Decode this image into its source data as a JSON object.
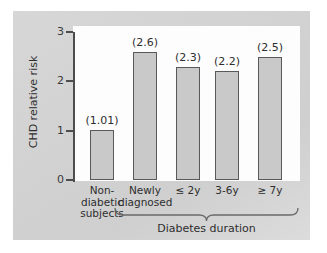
{
  "chart_data": {
    "type": "bar",
    "title": "",
    "xlabel": "",
    "ylabel": "CHD relative risk",
    "ylim": [
      0,
      3
    ],
    "yticks": [
      "0",
      "1",
      "2",
      "3"
    ],
    "grid": false,
    "legend": "none",
    "categories": [
      "Non-\ndiabetic\nsubjects",
      "Newly\ndiagnosed",
      "≤ 2y",
      "3-6y",
      "≥ 7y"
    ],
    "category_lines": [
      [
        "Non-",
        "diabetic",
        "subjects"
      ],
      [
        "Newly",
        "diagnosed"
      ],
      [
        "≤ 2y"
      ],
      [
        "3-6y"
      ],
      [
        "≥ 7y"
      ]
    ],
    "values": [
      1.01,
      2.6,
      2.3,
      2.2,
      2.5
    ],
    "data_labels": [
      "(1.01)",
      "(2.6)",
      "(2.3)",
      "(2.2)",
      "(2.5)"
    ],
    "annotations": [
      {
        "text": "Diabetes duration",
        "type": "group-brace",
        "covers": [
          "Newly\ndiagnosed",
          "≤ 2y",
          "3-6y",
          "≥ 7y"
        ]
      }
    ],
    "colors": {
      "bar_fill": "#c9c9c9",
      "bar_stroke": "#595959",
      "axis": "#4d4d4d",
      "panel_bg": "#d4d4d4",
      "plot_bg": "#fdfdfd",
      "text": "#2e2e2e"
    }
  }
}
